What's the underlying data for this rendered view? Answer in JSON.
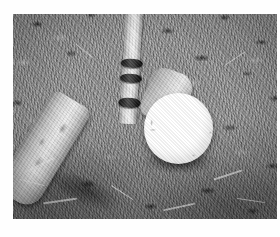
{
  "page": {
    "kind": "scanned-photograph",
    "orientation": "landscape",
    "color_mode": "black-and-white",
    "canvas_background": "#ffffff",
    "caption": ""
  },
  "photo": {
    "alt": "Black and white close-up photograph of a wooden croquet mallet resting on grass beside a white croquet ball",
    "frame": {
      "left": 13,
      "top": 14,
      "width": 264,
      "height": 205,
      "border_color": "#ffffff"
    },
    "tones": {
      "highlight": "#ffffff",
      "ball_white": "#fdfdfd",
      "wood_light": "#ebe9e3",
      "wood_mid": "#c8c6c0",
      "wood_shadow": "#7e7c76",
      "grass_mid": "#8d8d8d",
      "grass_dark": "#1a1a1a",
      "band_black": "#121212"
    },
    "subjects": [
      {
        "name": "mallet-shaft",
        "description": "Pale wooden handle entering the frame from the top edge, tilted slightly right",
        "tone": "light-gray"
      },
      {
        "name": "shaft-bands",
        "description": "Three dark rubber bands wrapped around the lower shaft",
        "count": 3,
        "tone": "near-black"
      },
      {
        "name": "mallet-head",
        "description": "Cylindrical wooden mallet head lying at an angle across the lower-left turf",
        "tone": "light-gray"
      },
      {
        "name": "croquet-ball",
        "description": "Bright white ball resting on the grass at the right of the mallet head",
        "tone": "white"
      },
      {
        "name": "grass-turf",
        "description": "Mottled, coarsely cut lawn filling the whole background with dark clumps and pale straw",
        "tone": "mid-gray"
      }
    ]
  }
}
